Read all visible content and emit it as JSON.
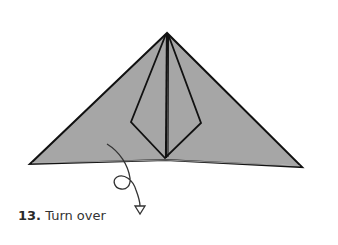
{
  "step": {
    "number": "13.",
    "instruction": "Turn over"
  },
  "colors": {
    "paper": "#a6a6a6",
    "line": "#111111",
    "arrow": "#333333",
    "background": "#ffffff"
  }
}
